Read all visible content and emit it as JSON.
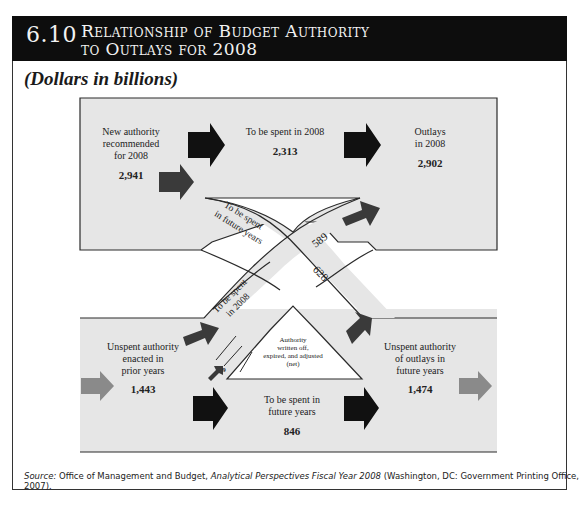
{
  "header": {
    "figure_number": "6.10",
    "title_line1": "Relationship of Budget Authority",
    "title_line2": "to Outlays for 2008"
  },
  "subtitle": "(Dollars in billions)",
  "diagram": {
    "top_box": {
      "new_authority": {
        "label_lines": [
          "New authority",
          "recommended",
          "for 2008"
        ],
        "value": "2,941"
      },
      "spent_2008": {
        "label": "To be spent in 2008",
        "value": "2,313"
      },
      "outlays_2008": {
        "label_lines": [
          "Outlays",
          "in 2008"
        ],
        "value": "2,902"
      }
    },
    "cross_bands": {
      "to_future": {
        "label_lines": [
          "To be spent",
          "in future years"
        ],
        "value": "628"
      },
      "to_2008": {
        "label_lines": [
          "To be spent",
          "in 2008"
        ],
        "value": "589"
      }
    },
    "bottom_band": {
      "unspent_prior": {
        "label_lines": [
          "Unspent authority",
          "enacted in",
          "prior years"
        ],
        "value": "1,443"
      },
      "written_off": {
        "label_lines": [
          "Authority",
          "written off,",
          "expired, and adjusted",
          "(net)"
        ],
        "value": "9"
      },
      "spent_future": {
        "label_lines": [
          "To be spent in",
          "future years"
        ],
        "value": "846"
      },
      "unspent_future": {
        "label_lines": [
          "Unspent authority",
          "of outlays in",
          "future years"
        ],
        "value": "1,474"
      }
    },
    "colors": {
      "band_fill": "#e6e6e6",
      "arrow_black": "#111111",
      "arrow_dark": "#3a3a3a",
      "arrow_gray": "#8a8a8a",
      "outline": "#2a2a2a"
    }
  },
  "source": {
    "prefix": "Source:",
    "text1": " Office of Management and Budget, ",
    "title": "Analytical Perspectives Fiscal Year 2008",
    "text2": " (Washington, DC: Government Printing Office, 2007)."
  }
}
